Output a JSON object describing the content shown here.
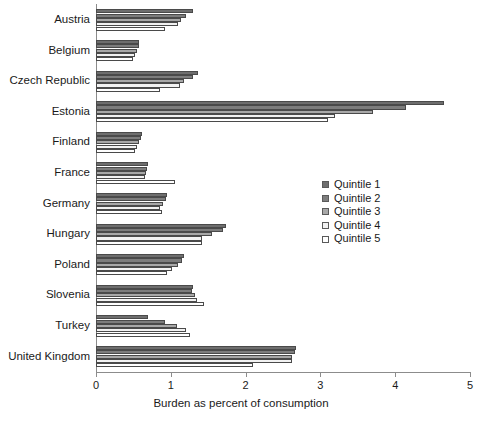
{
  "chart_data": {
    "type": "bar",
    "orientation": "horizontal",
    "title": "",
    "xlabel": "Burden as percent of consumption",
    "ylabel": "",
    "xlim": [
      0,
      5
    ],
    "xticks": [
      "0",
      "1",
      "2",
      "3",
      "4",
      "5"
    ],
    "grid": false,
    "legend_position": "center-right",
    "categories": [
      "Austria",
      "Belgium",
      "Czech Republic",
      "Estonia",
      "Finland",
      "France",
      "Germany",
      "Hungary",
      "Poland",
      "Slovenia",
      "Turkey",
      "United Kingdom"
    ],
    "series": [
      {
        "name": "Quintile 1",
        "color": "#6e6e6e",
        "values": [
          1.3,
          0.57,
          1.36,
          4.65,
          0.62,
          0.7,
          0.95,
          1.74,
          1.17,
          1.3,
          0.7,
          2.68
        ]
      },
      {
        "name": "Quintile 2",
        "color": "#7d7d7d",
        "values": [
          1.2,
          0.57,
          1.3,
          4.15,
          0.6,
          0.68,
          0.94,
          1.7,
          1.15,
          1.28,
          0.92,
          2.66
        ]
      },
      {
        "name": "Quintile 3",
        "color": "#a8a8a8",
        "values": [
          1.13,
          0.55,
          1.18,
          3.7,
          0.58,
          0.67,
          0.9,
          1.55,
          1.1,
          1.32,
          1.08,
          2.62
        ]
      },
      {
        "name": "Quintile 4",
        "color": "#f2f2f2",
        "values": [
          1.1,
          0.52,
          1.12,
          3.2,
          0.55,
          0.66,
          0.86,
          1.42,
          1.02,
          1.35,
          1.2,
          2.62
        ]
      },
      {
        "name": "Quintile 5",
        "color": "#ffffff",
        "values": [
          0.92,
          0.5,
          0.85,
          3.1,
          0.52,
          1.05,
          0.88,
          1.42,
          0.95,
          1.45,
          1.25,
          2.1
        ]
      }
    ]
  }
}
